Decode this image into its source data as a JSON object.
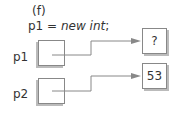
{
  "diagram": {
    "caption": "(f)",
    "statement": {
      "lhs": "p1 = ",
      "kw1": "new",
      "kw2": "int",
      "end": ";"
    },
    "pointers": [
      {
        "name": "p1",
        "target_value": "?"
      },
      {
        "name": "p2",
        "target_value": "53"
      }
    ],
    "colors": {
      "line": "#888888",
      "shadow": "#bbbbbb",
      "text": "#333333"
    }
  }
}
